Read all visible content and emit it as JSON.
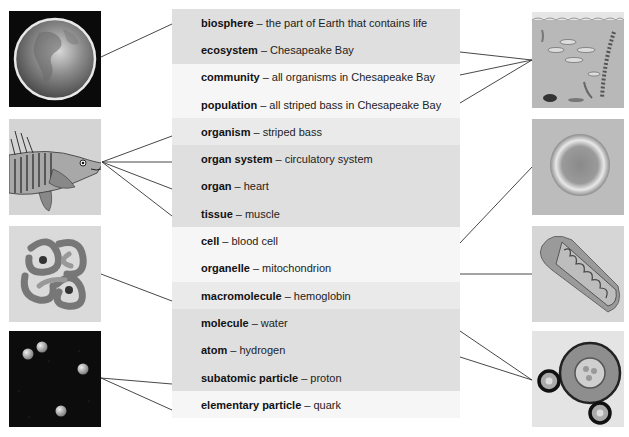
{
  "diagram": {
    "levels": [
      {
        "term": "biosphere",
        "separator": "–",
        "example": "the part of Earth that contains life",
        "shade": "dark"
      },
      {
        "term": "ecosystem",
        "separator": "–",
        "example": "Chesapeake Bay",
        "shade": "dark"
      },
      {
        "term": "community",
        "separator": "–",
        "example": "all organisms in Chesapeake Bay",
        "shade": "light"
      },
      {
        "term": "population",
        "separator": "–",
        "example": "all striped bass in Chesapeake Bay",
        "shade": "light"
      },
      {
        "term": "organism",
        "separator": "–",
        "example": "striped bass",
        "shade": "mid"
      },
      {
        "term": "organ system",
        "separator": "–",
        "example": "circulatory system",
        "shade": "dark"
      },
      {
        "term": "organ",
        "separator": "–",
        "example": "heart",
        "shade": "dark"
      },
      {
        "term": "tissue",
        "separator": "–",
        "example": "muscle",
        "shade": "dark"
      },
      {
        "term": "cell",
        "separator": "–",
        "example": "blood cell",
        "shade": "light"
      },
      {
        "term": "organelle",
        "separator": "–",
        "example": "mitochondrion",
        "shade": "light"
      },
      {
        "term": "macromolecule",
        "separator": "–",
        "example": "hemoglobin",
        "shade": "mid"
      },
      {
        "term": "molecule",
        "separator": "–",
        "example": "water",
        "shade": "dark"
      },
      {
        "term": "atom",
        "separator": "–",
        "example": "hydrogen",
        "shade": "dark"
      },
      {
        "term": "subatomic particle",
        "separator": "–",
        "example": "proton",
        "shade": "dark"
      },
      {
        "term": "elementary particle",
        "separator": "–",
        "example": "quark",
        "shade": "light"
      }
    ],
    "images": {
      "left": [
        {
          "name": "earth-image",
          "depicts": "Earth globe",
          "links_to": [
            "biosphere"
          ]
        },
        {
          "name": "fish-image",
          "depicts": "striped bass anatomy",
          "links_to": [
            "organism",
            "organ system",
            "organ",
            "tissue"
          ]
        },
        {
          "name": "hemoglobin-image",
          "depicts": "hemoglobin protein",
          "links_to": [
            "macromolecule"
          ]
        },
        {
          "name": "particles-image",
          "depicts": "subatomic particles",
          "links_to": [
            "subatomic particle",
            "elementary particle"
          ]
        }
      ],
      "right": [
        {
          "name": "bay-image",
          "depicts": "Chesapeake Bay ecosystem",
          "links_to": [
            "ecosystem",
            "community",
            "population"
          ]
        },
        {
          "name": "blood-cell-image",
          "depicts": "red blood cell",
          "links_to": [
            "cell"
          ]
        },
        {
          "name": "mitochondrion-image",
          "depicts": "mitochondrion",
          "links_to": [
            "organelle"
          ]
        },
        {
          "name": "atom-image",
          "depicts": "water molecule / hydrogen atom",
          "links_to": [
            "molecule",
            "atom"
          ]
        }
      ]
    },
    "colors": {
      "row_dark": "#dfdfdf",
      "row_mid": "#eaeaea",
      "row_light": "#f6f6f6",
      "line": "#333333"
    }
  }
}
